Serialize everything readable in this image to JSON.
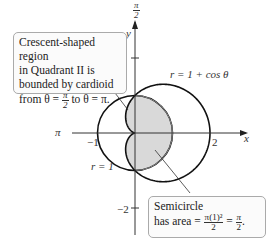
{
  "diagram": {
    "type": "polar-region-diagram",
    "curves": [
      {
        "name": "cardioid",
        "equation": "r = 1 + cos θ"
      },
      {
        "name": "circle",
        "equation": "r = 1"
      }
    ],
    "axes": {
      "x_label": "x",
      "y_label": "y",
      "pi_label": "π",
      "pi_over_2_label": {
        "num": "π",
        "den": "2"
      },
      "ticks": {
        "neg1": "−1",
        "pos2": "2",
        "y_pos2": "2",
        "y_neg2": "−2"
      }
    },
    "labels": {
      "cardioid": "r = 1 + cos θ",
      "circle": "r = 1"
    },
    "callouts": {
      "crescent": {
        "line1": "Crescent-shaped region",
        "line2": "in Quadrant II is",
        "line3": "bounded by cardioid",
        "line4_prefix": "from θ = ",
        "line4_frac": {
          "num": "π",
          "den": "2"
        },
        "line4_suffix": " to θ = π."
      },
      "semicircle": {
        "line1": "Semicircle",
        "line2_prefix": "has area = ",
        "area_frac1": {
          "num": "π(1)²",
          "den": "2"
        },
        "equals": " = ",
        "area_frac2": {
          "num": "π",
          "den": "2"
        },
        "period": "."
      }
    },
    "colors": {
      "curve": "#111111",
      "shade": "#d9d9d9",
      "axis": "#333333",
      "callout_border": "#aaaaaa"
    }
  }
}
